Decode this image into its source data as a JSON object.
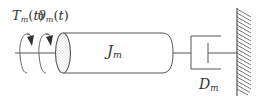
{
  "diagram": {
    "type": "mechanical-rotational-system",
    "labels": {
      "torque": {
        "symbol": "T",
        "subscript": "m",
        "arg": "t"
      },
      "angle": {
        "symbol": "θ",
        "subscript": "m",
        "arg": "t"
      },
      "inertia": {
        "symbol": "J",
        "subscript": "m"
      },
      "damper": {
        "symbol": "D",
        "subscript": "m"
      }
    },
    "components": [
      {
        "id": "shaft",
        "kind": "input shaft"
      },
      {
        "id": "torque-arrow",
        "kind": "rotation arrow"
      },
      {
        "id": "angle-arrow",
        "kind": "rotation arrow"
      },
      {
        "id": "inertia",
        "kind": "cylinder (rotor)"
      },
      {
        "id": "damper",
        "kind": "viscous damper"
      },
      {
        "id": "wall",
        "kind": "fixed ground"
      }
    ],
    "colors": {
      "stroke": "#555555",
      "text": "#333333",
      "stipple": "#888888"
    }
  }
}
